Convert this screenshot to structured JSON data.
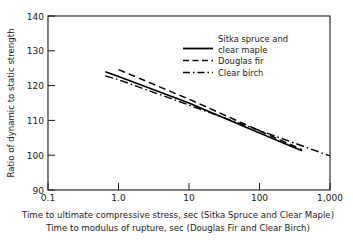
{
  "chart_data": {
    "type": "line",
    "title": "",
    "xlabel": "Time to ultimate compressive stress, sec (Sitka Spruce and Clear Maple)",
    "xlabel2": "Time to modulus of rupture, sec (Douglas Fir and Clear Birch)",
    "ylabel": "Ratio of dynamic to static strength",
    "xscale": "log",
    "xlim": [
      0.1,
      1000
    ],
    "ylim": [
      90,
      140
    ],
    "xticks": [
      0.1,
      1,
      10,
      100,
      1000
    ],
    "xtick_labels": [
      "0.1",
      "1.0",
      "10",
      "100",
      "1,000"
    ],
    "yticks": [
      90,
      100,
      110,
      120,
      130,
      140
    ],
    "ytick_labels": [
      "90",
      "100",
      "110",
      "120",
      "130",
      "140"
    ],
    "grid": false,
    "legend_position": "top-right",
    "series": [
      {
        "name": "Sitka spruce and clear maple",
        "style": "solid",
        "color": "#000000",
        "x": [
          0.65,
          1.0,
          10,
          100,
          400
        ],
        "y": [
          124.0,
          122.6,
          115.0,
          106.4,
          101.3
        ]
      },
      {
        "name": "Douglas fir",
        "style": "dashed",
        "color": "#000000",
        "x": [
          1.0,
          10,
          100,
          400
        ],
        "y": [
          124.6,
          116.1,
          107.0,
          101.6
        ]
      },
      {
        "name": "Clear birch",
        "style": "dashdot",
        "color": "#000000",
        "x": [
          0.65,
          1.0,
          10,
          100,
          1000
        ],
        "y": [
          122.8,
          121.7,
          114.4,
          107.1,
          99.8
        ]
      }
    ]
  },
  "legend": {
    "entries": [
      {
        "label_line1": "Sitka spruce and",
        "label_line2": "clear maple",
        "style": "solid"
      },
      {
        "label_line1": "Douglas fir",
        "label_line2": "",
        "style": "dashed"
      },
      {
        "label_line1": "Clear birch",
        "label_line2": "",
        "style": "dashdot"
      }
    ]
  },
  "axes": {
    "y_label": "Ratio of dynamic to static strength",
    "x_label_line1": "Time to ultimate compressive stress, sec (Sitka Spruce and Clear Maple)",
    "x_label_line2": "Time to modulus of rupture, sec (Douglas Fir and Clear Birch)",
    "ytick_0": "90",
    "ytick_1": "100",
    "ytick_2": "110",
    "ytick_3": "120",
    "ytick_4": "130",
    "ytick_5": "140",
    "xtick_0": "0.1",
    "xtick_1": "1.0",
    "xtick_2": "10",
    "xtick_3": "100",
    "xtick_4": "1,000"
  },
  "colors": {
    "ink": "#1a1a1a",
    "line": "#000000",
    "background": "#ffffff"
  }
}
